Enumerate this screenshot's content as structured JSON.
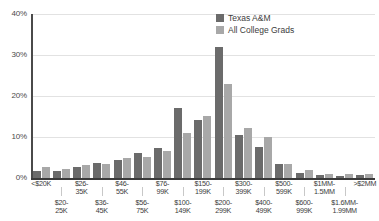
{
  "legend": {
    "position": "top-right",
    "items": [
      {
        "label": "Texas A&M",
        "color": "#6b6b6b"
      },
      {
        "label": "All College Grads",
        "color": "#a8a8a8"
      }
    ]
  },
  "axis": {
    "y_ticks": [
      "0%",
      "10%",
      "20%",
      "30%",
      "40%"
    ]
  },
  "chart_data": {
    "type": "bar",
    "title": "",
    "xlabel": "",
    "ylabel": "",
    "ylim": [
      0,
      40
    ],
    "grid": true,
    "legend_position": "top-right",
    "categories": [
      "<$20K",
      "$20-25K",
      "$26-35K",
      "$36-45K",
      "$46-55K",
      "$56-75K",
      "$76-99K",
      "$100-149K",
      "$150-199K",
      "$200-299K",
      "$300-399K",
      "$400-499K",
      "$500-599K",
      "$600-999K",
      "$1MM-1.5MM",
      "$1.6MM-1.99MM",
      ">$2MM"
    ],
    "series": [
      {
        "name": "Texas A&M",
        "color": "#6b6b6b",
        "values": [
          1.8,
          1.6,
          2.6,
          3.6,
          4.4,
          6.0,
          7.2,
          17.0,
          14.2,
          32.0,
          10.6,
          7.6,
          3.5,
          1.3,
          0.7,
          0.5,
          0.8
        ]
      },
      {
        "name": "All College Grads",
        "color": "#a8a8a8",
        "values": [
          2.7,
          2.2,
          3.1,
          3.5,
          4.8,
          5.2,
          6.6,
          11.0,
          15.2,
          23.0,
          12.2,
          10.0,
          3.4,
          2.0,
          1.0,
          0.9,
          1.1
        ]
      }
    ]
  },
  "x_tick_labels": [
    {
      "lines": [
        "<$20K"
      ],
      "row": 0
    },
    {
      "lines": [
        "$20-",
        "25K"
      ],
      "row": 1
    },
    {
      "lines": [
        "$26-",
        "35K"
      ],
      "row": 0
    },
    {
      "lines": [
        "$36-",
        "45K"
      ],
      "row": 1
    },
    {
      "lines": [
        "$46-",
        "55K"
      ],
      "row": 0
    },
    {
      "lines": [
        "$56-",
        "75K"
      ],
      "row": 1
    },
    {
      "lines": [
        "$76-",
        "99K"
      ],
      "row": 0
    },
    {
      "lines": [
        "$100-",
        "149K"
      ],
      "row": 1
    },
    {
      "lines": [
        "$150-",
        "199K"
      ],
      "row": 0
    },
    {
      "lines": [
        "$200-",
        "299K"
      ],
      "row": 1
    },
    {
      "lines": [
        "$300-",
        "399K"
      ],
      "row": 0
    },
    {
      "lines": [
        "$400-",
        "499K"
      ],
      "row": 1
    },
    {
      "lines": [
        "$500-",
        "599K"
      ],
      "row": 0
    },
    {
      "lines": [
        "$600-",
        "999K"
      ],
      "row": 1
    },
    {
      "lines": [
        "$1MM-",
        "1.5MM"
      ],
      "row": 0
    },
    {
      "lines": [
        "$1.6MM-",
        "1.99MM"
      ],
      "row": 1
    },
    {
      "lines": [
        ">$2MM"
      ],
      "row": 0
    }
  ]
}
